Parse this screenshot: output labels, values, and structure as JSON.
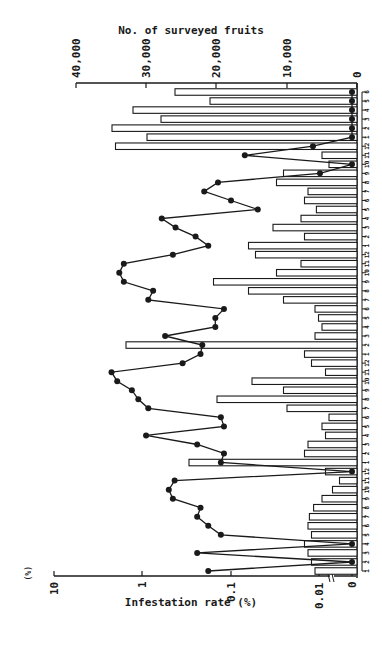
{
  "chart_data": {
    "type": "bar+line",
    "orientation": "rotated 90 degrees clockwise (time runs bottom-to-top, values extend leftward)",
    "title_top_axis": "No. of surveyed fruits",
    "title_bottom_axis": "Infestation rate (%)",
    "unit_label": "(%)",
    "top_axis": {
      "label": "No. of surveyed fruits",
      "ticks": [
        "0",
        "10,000",
        "20,000",
        "30,000",
        "40,000"
      ],
      "range": [
        0,
        40000
      ],
      "scale": "linear"
    },
    "bottom_axis": {
      "label": "Infestation rate (%)",
      "ticks": [
        "0",
        "0.01",
        "0.1",
        "1",
        "10"
      ],
      "range": [
        0,
        10
      ],
      "scale": "log (with break at 0)"
    },
    "x": [
      "1",
      "2",
      "3",
      "4",
      "5",
      "6",
      "7",
      "8",
      "9",
      "10",
      "11",
      "12",
      "1",
      "2",
      "3",
      "4",
      "5",
      "6",
      "7",
      "8",
      "9",
      "10",
      "11",
      "12",
      "1",
      "2",
      "3",
      "4",
      "5",
      "6",
      "7",
      "8",
      "9",
      "10",
      "11",
      "12",
      "1",
      "2",
      "3",
      "4",
      "5",
      "6",
      "7",
      "8",
      "9",
      "10",
      "11",
      "12",
      "1",
      "2",
      "3",
      "4",
      "5",
      "6"
    ],
    "xlabel": "Month",
    "series": [
      {
        "name": "No. of surveyed fruits",
        "type": "bar",
        "values": [
          6000,
          6500,
          7000,
          7500,
          6500,
          7000,
          6800,
          6200,
          5000,
          3500,
          2500,
          4500,
          24000,
          7500,
          7000,
          4500,
          5000,
          4000,
          10000,
          20000,
          10500,
          15000,
          4500,
          6500,
          7500,
          33000,
          6000,
          5000,
          5500,
          6000,
          10500,
          15500,
          20500,
          11500,
          8000,
          14500,
          15500,
          7500,
          12000,
          8000,
          5800,
          7500,
          7000,
          11500,
          10500,
          4000,
          5000,
          34500,
          30000,
          35000,
          28000,
          32000,
          21000,
          26000
        ],
        "note": "some months have overlaid black (dark) inner bars; values are estimated"
      },
      {
        "name": "Infestation rate (%)",
        "type": "line",
        "marker": "filled circle",
        "values": [
          0.18,
          0,
          0.24,
          0,
          0.13,
          0.18,
          0.24,
          0.22,
          0.45,
          0.5,
          0.43,
          0,
          0.13,
          0.12,
          0.24,
          0.9,
          0.12,
          0.13,
          0.85,
          1.1,
          1.3,
          1.9,
          2.2,
          0.35,
          0.22,
          0.21,
          0.55,
          0.15,
          0.15,
          0.12,
          0.85,
          0.75,
          1.6,
          1.8,
          1.6,
          0.45,
          0.18,
          0.25,
          0.42,
          0.6,
          0.05,
          0.1,
          0.2,
          0.14,
          0.01,
          0,
          0.07,
          0.012,
          0,
          0,
          0,
          0,
          0,
          0
        ],
        "note": "log-scale readings estimated from pixel positions; 0 denotes points on the zero baseline"
      }
    ],
    "grid": false,
    "legend": "none"
  }
}
